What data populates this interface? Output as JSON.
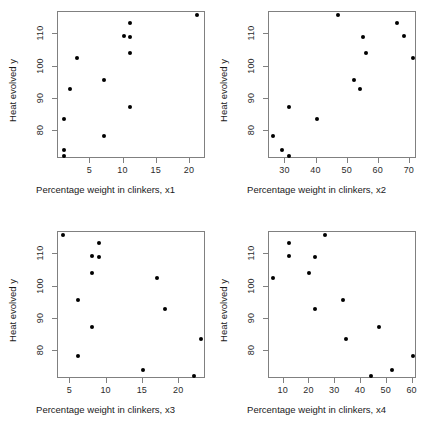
{
  "figure": {
    "width": 422,
    "height": 440,
    "background": "#ffffff",
    "point_color": "#000000",
    "axis_color": "#808080",
    "layout": "2x2 scatterplot matrix"
  },
  "chart_data": [
    {
      "type": "scatter",
      "title": "",
      "xlabel": "Percentage weight in clinkers, x1",
      "ylabel": "Heat evolved y",
      "xlim": [
        0.13,
        22.4
      ],
      "ylim": [
        71.5,
        116.8
      ],
      "xticks": [
        5,
        10,
        15,
        20
      ],
      "yticks": [
        80,
        90,
        100,
        110
      ],
      "grid": false,
      "legend": "none",
      "x": [
        7,
        1,
        11,
        11,
        7,
        11,
        3,
        1,
        2,
        21,
        1,
        11,
        10
      ],
      "y": [
        78.5,
        74.3,
        104.3,
        87.6,
        95.9,
        109.2,
        102.7,
        72.5,
        93.1,
        115.9,
        83.8,
        113.3,
        109.4
      ]
    },
    {
      "type": "scatter",
      "title": "",
      "xlabel": "Percentage weight in clinkers, x2",
      "ylabel": "Heat evolved y",
      "xlim": [
        24.7,
        72.3
      ],
      "ylim": [
        71.5,
        116.8
      ],
      "xticks": [
        30,
        40,
        50,
        60,
        70
      ],
      "yticks": [
        80,
        90,
        100,
        110
      ],
      "grid": false,
      "legend": "none",
      "x": [
        26,
        29,
        56,
        31,
        52,
        55,
        71,
        31,
        54,
        47,
        40,
        66,
        68
      ],
      "y": [
        78.5,
        74.3,
        104.3,
        87.6,
        95.9,
        109.2,
        102.7,
        72.5,
        93.1,
        115.9,
        83.8,
        113.3,
        109.4
      ]
    },
    {
      "type": "scatter",
      "title": "",
      "xlabel": "Percentage weight in clinkers, x3",
      "ylabel": "Heat evolved y",
      "xlim": [
        3.3,
        23.7
      ],
      "ylim": [
        71.5,
        116.8
      ],
      "xticks": [
        5,
        10,
        15,
        20
      ],
      "yticks": [
        80,
        90,
        100,
        110
      ],
      "grid": false,
      "legend": "none",
      "x": [
        6,
        15,
        8,
        8,
        6,
        9,
        17,
        22,
        18,
        4,
        23,
        9,
        8
      ],
      "y": [
        78.5,
        74.3,
        104.3,
        87.6,
        95.9,
        109.2,
        102.7,
        72.5,
        93.1,
        115.9,
        83.8,
        113.3,
        109.4
      ]
    },
    {
      "type": "scatter",
      "title": "",
      "xlabel": "Percentage weight in clinkers, x4",
      "ylabel": "Heat evolved y",
      "xlim": [
        4.3,
        61.7
      ],
      "ylim": [
        71.5,
        116.8
      ],
      "xticks": [
        10,
        20,
        30,
        40,
        50,
        60
      ],
      "yticks": [
        80,
        90,
        100,
        110
      ],
      "grid": false,
      "legend": "none",
      "x": [
        60,
        52,
        20,
        47,
        33,
        22,
        6,
        44,
        22,
        26,
        34,
        12,
        12
      ],
      "y": [
        78.5,
        74.3,
        104.3,
        87.6,
        95.9,
        109.2,
        102.7,
        72.5,
        93.1,
        115.9,
        83.8,
        113.3,
        109.4
      ]
    }
  ]
}
